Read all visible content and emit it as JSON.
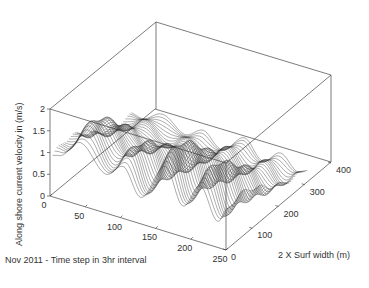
{
  "chart_data": {
    "type": "line",
    "subtype": "3d-waterfall",
    "title": "",
    "xlabel": "Nov 2011 - Time step in 3hr interval",
    "ylabel": "2 X Surf width (m)",
    "zlabel": "Along shore current velocity in (m/s)",
    "xlim": [
      0,
      250
    ],
    "ylim": [
      0,
      400
    ],
    "zlim": [
      0,
      2
    ],
    "x_ticks": [
      "0",
      "50",
      "100",
      "150",
      "200",
      "250"
    ],
    "y_ticks": [
      "0",
      "100",
      "200",
      "300",
      "400"
    ],
    "z_ticks": [
      "0",
      "0.5",
      "1",
      "1.5",
      "2"
    ],
    "grid": false,
    "legend": null,
    "line_color": "#333333",
    "approx_series_count": 40,
    "series_description": "Many stacked curves (one per cross-shore position, ~0-320 m) of alongshore velocity vs time step; peaks reach ~1.3-1.5 m/s near time steps 30-50, 90-100, 150-165 and 200-215, with lows near 0.2-0.4 m/s between peaks.",
    "representative_peaks": [
      {
        "x": 10,
        "z": 0.9
      },
      {
        "x": 40,
        "z": 1.45
      },
      {
        "x": 75,
        "z": 0.8
      },
      {
        "x": 100,
        "z": 1.2
      },
      {
        "x": 125,
        "z": 0.5
      },
      {
        "x": 160,
        "z": 1.5
      },
      {
        "x": 185,
        "z": 0.6
      },
      {
        "x": 210,
        "z": 1.3
      },
      {
        "x": 235,
        "z": 0.5
      },
      {
        "x": 250,
        "z": 0.9
      }
    ]
  }
}
